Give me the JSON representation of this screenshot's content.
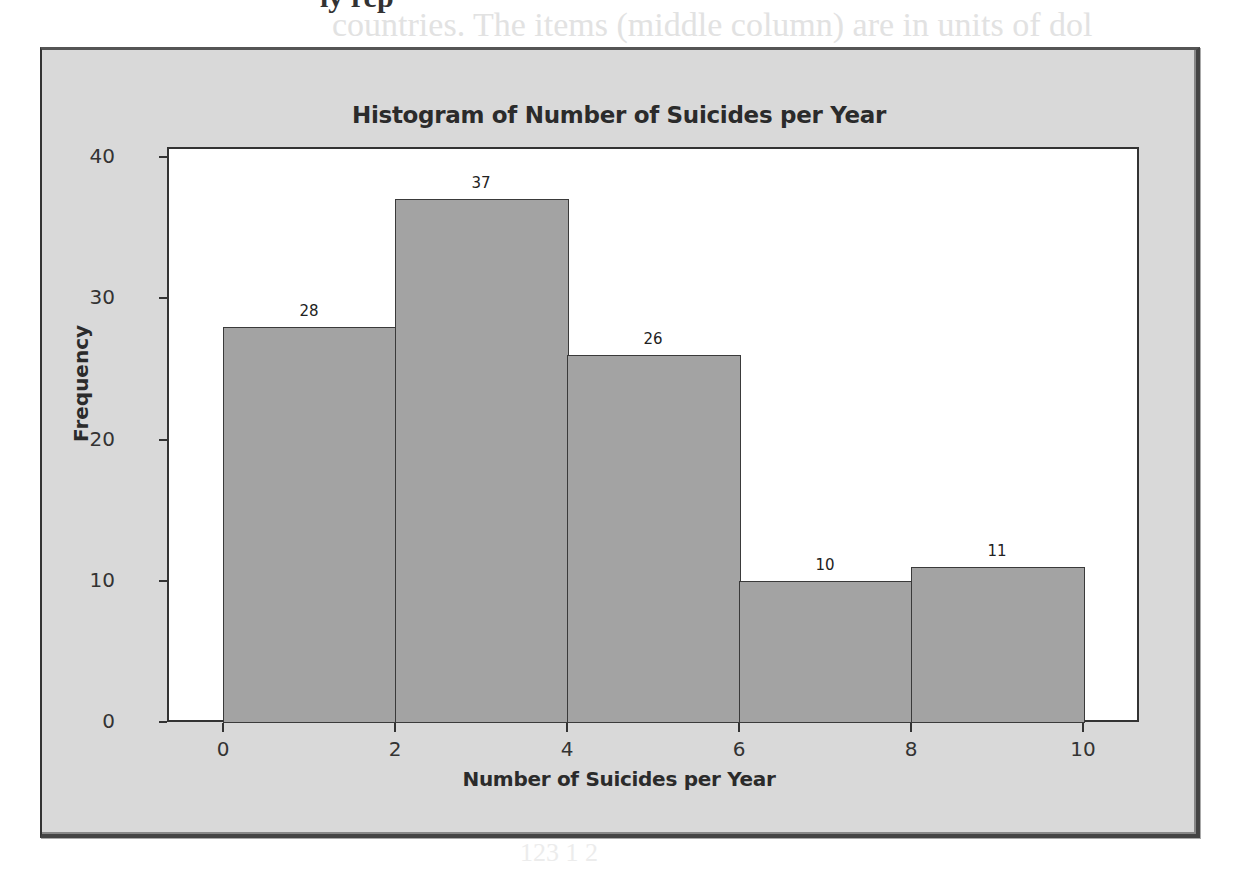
{
  "background_text": {
    "line1": "ly rep",
    "line2": "countries. The items (middle column) are in units of dol",
    "line3": "123 1 2"
  },
  "chart_data": {
    "type": "bar",
    "subtype": "histogram",
    "title": "Histogram of Number of Suicides per Year",
    "xlabel": "Number of Suicides per Year",
    "ylabel": "Frequency",
    "bins": [
      {
        "range": [
          0,
          2
        ],
        "value": 28
      },
      {
        "range": [
          2,
          4
        ],
        "value": 37
      },
      {
        "range": [
          4,
          6
        ],
        "value": 26
      },
      {
        "range": [
          6,
          8
        ],
        "value": 10
      },
      {
        "range": [
          8,
          10
        ],
        "value": 11
      }
    ],
    "categories": [
      "0-2",
      "2-4",
      "4-6",
      "6-8",
      "8-10"
    ],
    "values": [
      28,
      37,
      26,
      10,
      11
    ],
    "xticks": [
      "0",
      "2",
      "4",
      "6",
      "8",
      "10"
    ],
    "yticks": [
      "0",
      "10",
      "20",
      "30",
      "40"
    ],
    "xlim": [
      -1.2,
      10.7
    ],
    "ylim": [
      0,
      40.7
    ],
    "grid": false,
    "legend": null,
    "data_labels": true,
    "colors": {
      "bar_fill": "#a3a3a3",
      "bar_edge": "#3a3a3a",
      "plot_bg": "#ffffff",
      "frame_bg": "#d9d9d9"
    }
  }
}
